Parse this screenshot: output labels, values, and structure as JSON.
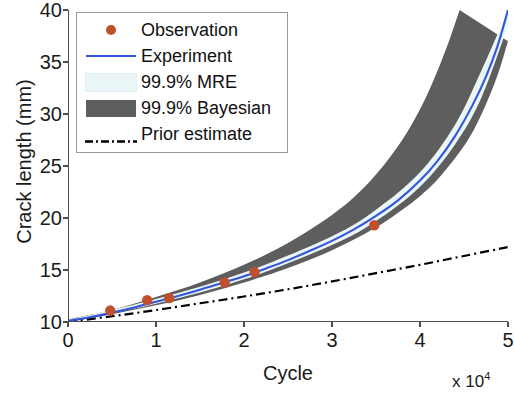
{
  "chart_data": {
    "type": "line",
    "title": "",
    "xlabel": "Cycle",
    "ylabel": "Crack length (mm)",
    "x_multiplier": "x 10",
    "x_multiplier_exp": "4",
    "xlim": [
      0,
      5
    ],
    "ylim": [
      10,
      40
    ],
    "xticks": [
      0,
      1,
      2,
      3,
      4,
      5
    ],
    "xtick_labels": [
      "0",
      "1",
      "2",
      "3",
      "4",
      "5"
    ],
    "yticks": [
      10,
      15,
      20,
      25,
      30,
      35,
      40
    ],
    "ytick_labels": [
      "10",
      "15",
      "20",
      "25",
      "30",
      "35",
      "40"
    ],
    "grid": false,
    "legend_position": "upper-left",
    "x_units": "cycles (x 10^4)",
    "y_units": "mm",
    "series": [
      {
        "name": "Observation",
        "type": "scatter",
        "color": "#C0502C",
        "points": [
          {
            "x": 0.48,
            "y": 11.1
          },
          {
            "x": 0.9,
            "y": 12.1
          },
          {
            "x": 1.15,
            "y": 12.3
          },
          {
            "x": 1.78,
            "y": 13.8
          },
          {
            "x": 2.12,
            "y": 14.8
          },
          {
            "x": 3.48,
            "y": 19.3
          }
        ]
      },
      {
        "name": "Experiment",
        "type": "line",
        "color": "#3355DD",
        "points": [
          {
            "x": 0.0,
            "y": 10.1
          },
          {
            "x": 0.25,
            "y": 10.45
          },
          {
            "x": 0.5,
            "y": 10.9
          },
          {
            "x": 0.75,
            "y": 11.4
          },
          {
            "x": 1.0,
            "y": 11.95
          },
          {
            "x": 1.25,
            "y": 12.5
          },
          {
            "x": 1.5,
            "y": 13.1
          },
          {
            "x": 1.75,
            "y": 13.75
          },
          {
            "x": 2.0,
            "y": 14.4
          },
          {
            "x": 2.25,
            "y": 15.15
          },
          {
            "x": 2.5,
            "y": 15.95
          },
          {
            "x": 2.75,
            "y": 16.85
          },
          {
            "x": 3.0,
            "y": 17.8
          },
          {
            "x": 3.25,
            "y": 18.9
          },
          {
            "x": 3.5,
            "y": 20.2
          },
          {
            "x": 3.75,
            "y": 21.7
          },
          {
            "x": 4.0,
            "y": 23.6
          },
          {
            "x": 4.2,
            "y": 25.5
          },
          {
            "x": 4.4,
            "y": 27.9
          },
          {
            "x": 4.6,
            "y": 30.9
          },
          {
            "x": 4.75,
            "y": 33.6
          },
          {
            "x": 4.88,
            "y": 36.5
          },
          {
            "x": 5.0,
            "y": 40.0
          }
        ]
      },
      {
        "name": "99.9% MRE",
        "type": "band",
        "color": "#EAF6F8",
        "lower": [
          {
            "x": 0.0,
            "y": 10.05
          },
          {
            "x": 1.0,
            "y": 11.75
          },
          {
            "x": 2.0,
            "y": 14.1
          },
          {
            "x": 3.0,
            "y": 17.4
          },
          {
            "x": 3.5,
            "y": 19.7
          },
          {
            "x": 4.0,
            "y": 23.0
          },
          {
            "x": 4.4,
            "y": 27.1
          },
          {
            "x": 4.7,
            "y": 31.6
          },
          {
            "x": 5.0,
            "y": 38.5
          }
        ],
        "upper": [
          {
            "x": 0.0,
            "y": 10.18
          },
          {
            "x": 1.0,
            "y": 12.2
          },
          {
            "x": 2.0,
            "y": 14.75
          },
          {
            "x": 3.0,
            "y": 18.25
          },
          {
            "x": 3.5,
            "y": 20.8
          },
          {
            "x": 4.0,
            "y": 24.4
          },
          {
            "x": 4.4,
            "y": 29.0
          },
          {
            "x": 4.7,
            "y": 34.2
          },
          {
            "x": 5.0,
            "y": 40.0
          }
        ]
      },
      {
        "name": "99.9% Bayesian",
        "type": "band",
        "color": "#5E5E5E",
        "lower": [
          {
            "x": 0.0,
            "y": 10.0
          },
          {
            "x": 0.5,
            "y": 10.75
          },
          {
            "x": 1.0,
            "y": 11.6
          },
          {
            "x": 1.5,
            "y": 12.6
          },
          {
            "x": 2.0,
            "y": 13.8
          },
          {
            "x": 2.5,
            "y": 15.2
          },
          {
            "x": 3.0,
            "y": 16.9
          },
          {
            "x": 3.5,
            "y": 19.1
          },
          {
            "x": 4.0,
            "y": 22.1
          },
          {
            "x": 4.3,
            "y": 24.7
          },
          {
            "x": 4.6,
            "y": 28.3
          },
          {
            "x": 4.85,
            "y": 33.0
          },
          {
            "x": 5.0,
            "y": 37.0
          }
        ],
        "upper": [
          {
            "x": 0.0,
            "y": 10.25
          },
          {
            "x": 0.5,
            "y": 11.15
          },
          {
            "x": 1.0,
            "y": 12.4
          },
          {
            "x": 1.5,
            "y": 13.8
          },
          {
            "x": 2.0,
            "y": 15.5
          },
          {
            "x": 2.5,
            "y": 17.6
          },
          {
            "x": 3.0,
            "y": 20.3
          },
          {
            "x": 3.3,
            "y": 22.4
          },
          {
            "x": 3.6,
            "y": 25.2
          },
          {
            "x": 3.85,
            "y": 28.2
          },
          {
            "x": 4.05,
            "y": 31.3
          },
          {
            "x": 4.22,
            "y": 34.6
          },
          {
            "x": 4.35,
            "y": 37.5
          },
          {
            "x": 4.45,
            "y": 40.0
          }
        ]
      },
      {
        "name": "Prior estimate",
        "type": "dashdot",
        "color": "#000000",
        "points": [
          {
            "x": 0.0,
            "y": 10.0
          },
          {
            "x": 0.5,
            "y": 10.55
          },
          {
            "x": 1.0,
            "y": 11.15
          },
          {
            "x": 1.5,
            "y": 11.8
          },
          {
            "x": 2.0,
            "y": 12.45
          },
          {
            "x": 2.5,
            "y": 13.15
          },
          {
            "x": 3.0,
            "y": 13.9
          },
          {
            "x": 3.5,
            "y": 14.7
          },
          {
            "x": 4.0,
            "y": 15.5
          },
          {
            "x": 4.5,
            "y": 16.35
          },
          {
            "x": 5.0,
            "y": 17.2
          }
        ]
      }
    ]
  },
  "legend": {
    "entries": [
      {
        "label": "Observation",
        "key": "marker-dot",
        "color": "#C0502C"
      },
      {
        "label": "Experiment",
        "key": "solid-line",
        "color": "#3355DD"
      },
      {
        "label": "99.9% MRE",
        "key": "patch",
        "color": "#EAF6F8"
      },
      {
        "label": "99.9% Bayesian",
        "key": "patch",
        "color": "#5E5E5E"
      },
      {
        "label": "Prior estimate",
        "key": "dashdot-line",
        "color": "#000000"
      }
    ]
  },
  "axes": {
    "y_title": "Crack length (mm)",
    "x_title": "Cycle",
    "x_multiplier_text": "x 10",
    "x_multiplier_sup": "4"
  },
  "colors": {
    "observation": "#C0502C",
    "experiment": "#3355DD",
    "mre_band": "#EAF6F8",
    "bayesian_band": "#5E5E5E",
    "prior": "#000000",
    "axis": "#4d4d4d",
    "text": "#1a1a1a"
  }
}
